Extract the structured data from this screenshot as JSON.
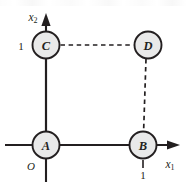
{
  "figure": {
    "type": "diagram",
    "kind": "coordinate-axes-node-graph",
    "width": 187,
    "height": 186,
    "background_color": "#ffffff",
    "ink_color": "#231f20",
    "node_fill_color": "#e9e9e9"
  },
  "axes": {
    "x_axis": {
      "name": "x1",
      "label_base": "x",
      "label_sub": "1",
      "direction": "right",
      "arrow": true,
      "tick_labels": [
        "1"
      ]
    },
    "y_axis": {
      "name": "x2",
      "label_base": "x",
      "label_sub": "2",
      "direction": "up",
      "arrow": true,
      "tick_labels": [
        "1"
      ]
    },
    "origin_label": "O"
  },
  "nodes": [
    {
      "id": "A",
      "label": "A",
      "cx": 46,
      "cy": 145,
      "r": 13.5,
      "coord": [
        0,
        0
      ]
    },
    {
      "id": "B",
      "label": "B",
      "cx": 143,
      "cy": 145,
      "r": 13.5,
      "coord": [
        1,
        0
      ]
    },
    {
      "id": "C",
      "label": "C",
      "cx": 46,
      "cy": 45,
      "r": 13.5,
      "coord": [
        0,
        1
      ]
    },
    {
      "id": "D",
      "label": "D",
      "cx": 148,
      "cy": 45,
      "r": 13.5,
      "coord": [
        1,
        1
      ]
    }
  ],
  "edges": [
    {
      "id": "A-C",
      "from": "A",
      "to": "C",
      "style": "solid"
    },
    {
      "id": "A-B",
      "from": "A",
      "to": "B",
      "style": "solid"
    },
    {
      "id": "C-D",
      "from": "C",
      "to": "D",
      "style": "dashed"
    },
    {
      "id": "D-B",
      "from": "D",
      "to": "B",
      "style": "dashed"
    }
  ],
  "tick_values": {
    "y_one": "1",
    "x_one": "1"
  }
}
